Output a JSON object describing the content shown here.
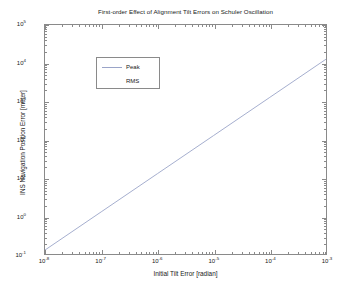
{
  "chart_data": {
    "type": "line",
    "title": "First-order Effect of Alignment Tilt Errors on Schuler Oscillation",
    "xlabel": "Initial Tilt Error [radian]",
    "ylabel": "INS Navigation Position Error [meter]",
    "xscale": "log",
    "yscale": "log",
    "xlim": [
      1e-08,
      0.001
    ],
    "ylim": [
      0.1,
      100000
    ],
    "grid": false,
    "legend_position": "upper-left",
    "xticks": [
      {
        "value": 1e-08,
        "label": "10",
        "exponent": "-8"
      },
      {
        "value": 1e-07,
        "label": "10",
        "exponent": "-7"
      },
      {
        "value": 1e-06,
        "label": "10",
        "exponent": "-6"
      },
      {
        "value": 1e-05,
        "label": "10",
        "exponent": "-5"
      },
      {
        "value": 0.0001,
        "label": "10",
        "exponent": "-4"
      },
      {
        "value": 0.001,
        "label": "10",
        "exponent": "-3"
      }
    ],
    "yticks": [
      {
        "value": 0.1,
        "label": "10",
        "exponent": "-1"
      },
      {
        "value": 1,
        "label": "10",
        "exponent": "0"
      },
      {
        "value": 10,
        "label": "10",
        "exponent": "1"
      },
      {
        "value": 100,
        "label": "10",
        "exponent": "2"
      },
      {
        "value": 1000,
        "label": "10",
        "exponent": "3"
      },
      {
        "value": 10000,
        "label": "10",
        "exponent": "4"
      },
      {
        "value": 100000,
        "label": "10",
        "exponent": "5"
      }
    ],
    "series": [
      {
        "name": "Peak",
        "color": "#9aa4c8",
        "visible": true,
        "x": [
          1e-08,
          1e-07,
          1e-06,
          1e-05,
          0.0001,
          0.001
        ],
        "y": [
          0.127,
          1.27,
          12.7,
          127,
          1270,
          12700
        ]
      },
      {
        "name": "RMS",
        "color": "#9aa4c8",
        "visible": false,
        "x": [],
        "y": []
      }
    ]
  },
  "legend": {
    "entries": [
      {
        "label": "Peak"
      },
      {
        "label": "RMS"
      }
    ]
  }
}
